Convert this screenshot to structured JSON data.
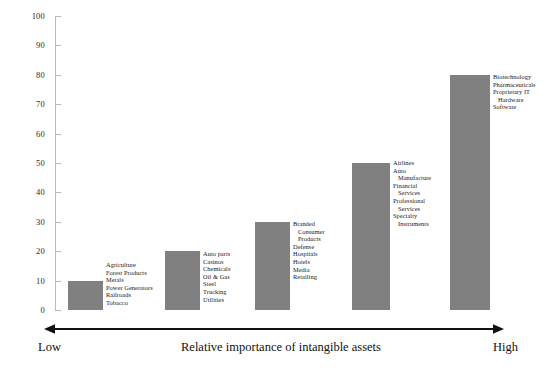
{
  "chart_data": {
    "type": "bar",
    "title": "",
    "xlabel": "Relative importance of intangible assets",
    "ylabel": "",
    "ylim": [
      0,
      100
    ],
    "yticks": [
      0,
      10,
      20,
      30,
      40,
      50,
      60,
      70,
      80,
      90,
      100
    ],
    "grid": false,
    "legend": "none",
    "bar_color": "#808080",
    "categories": [
      "Agriculture / Forest Products / Metals / Power Generators / Railroads / Tobacco",
      "Auto parts / Casinos / Chemicals / Oil & Gas / Steel / Trucking / Utilities",
      "Branded Consumer Products / Defense / Hospitals / Hotels / Media / Retailing",
      "Airlines / Auto Manufacture / Financial Services / Professional Services / Specialty Instruments",
      "Biotechnology / Pharmaceuticals / Proprietary IT Hardware / Software"
    ],
    "values": [
      10,
      20,
      30,
      50,
      80
    ],
    "bars": [
      {
        "value": 10,
        "labels": [
          {
            "text": "Agriculture",
            "continuation": false
          },
          {
            "text": "Forest Products",
            "continuation": false
          },
          {
            "text": "Metals",
            "continuation": false
          },
          {
            "text": "Power Generators",
            "continuation": false
          },
          {
            "text": "Railroads",
            "continuation": false
          },
          {
            "text": "Tobacco",
            "continuation": false
          }
        ]
      },
      {
        "value": 20,
        "labels": [
          {
            "text": "Auto parts",
            "continuation": false
          },
          {
            "text": "Casinos",
            "continuation": false
          },
          {
            "text": "Chemicals",
            "continuation": false
          },
          {
            "text": "Oil & Gas",
            "continuation": false
          },
          {
            "text": "Steel",
            "continuation": false
          },
          {
            "text": "Trucking",
            "continuation": false
          },
          {
            "text": "Utilities",
            "continuation": false
          }
        ]
      },
      {
        "value": 30,
        "labels": [
          {
            "text": "Branded",
            "continuation": false
          },
          {
            "text": "Consumer",
            "continuation": true
          },
          {
            "text": "Products",
            "continuation": true
          },
          {
            "text": "Defense",
            "continuation": false
          },
          {
            "text": "Hospitals",
            "continuation": false
          },
          {
            "text": "Hotels",
            "continuation": false
          },
          {
            "text": "Media",
            "continuation": false
          },
          {
            "text": "Retailing",
            "continuation": false
          }
        ]
      },
      {
        "value": 50,
        "labels": [
          {
            "text": "Airlines",
            "continuation": false
          },
          {
            "text": "Auto",
            "continuation": false
          },
          {
            "text": "Manufacture",
            "continuation": true
          },
          {
            "text": "Financial",
            "continuation": false
          },
          {
            "text": "Services",
            "continuation": true
          },
          {
            "text": "Professional",
            "continuation": false
          },
          {
            "text": "Services",
            "continuation": true
          },
          {
            "text": "Specialty",
            "continuation": false
          },
          {
            "text": "Instruments",
            "continuation": true
          }
        ]
      },
      {
        "value": 80,
        "labels": [
          {
            "text": "Biotechnology",
            "continuation": false
          },
          {
            "text": "Pharmaceuticals",
            "continuation": false
          },
          {
            "text": "Proprietary IT",
            "continuation": false
          },
          {
            "text": "Hardware",
            "continuation": true
          },
          {
            "text": "Software",
            "continuation": false
          }
        ]
      }
    ]
  },
  "axis": {
    "low_label": "Low",
    "high_label": "High",
    "center_label": "Relative importance of intangible assets"
  }
}
